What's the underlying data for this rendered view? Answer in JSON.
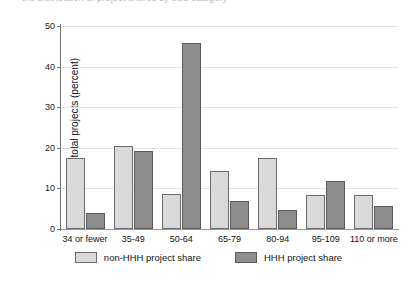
{
  "figure": {
    "top_caption_fragment": "the distribution of project shares by size category"
  },
  "chart_data": {
    "type": "bar",
    "title": "",
    "xlabel": "",
    "ylabel": "Share of total projects (percent)",
    "categories": [
      "34 or fewer",
      "35-49",
      "50-64",
      "65-79",
      "80-94",
      "95-109",
      "110 or more"
    ],
    "series": [
      {
        "name": "non-HHH project share",
        "color": "#d9d9d9",
        "values": [
          17.6,
          20.4,
          8.7,
          14.4,
          17.4,
          8.5,
          8.5
        ]
      },
      {
        "name": "HHH project share",
        "color": "#8e8e8e",
        "values": [
          4.0,
          19.3,
          45.9,
          6.9,
          4.8,
          11.9,
          5.7
        ]
      }
    ],
    "ylim": [
      0,
      50
    ],
    "yticks": [
      0,
      10,
      20,
      30,
      40,
      50
    ],
    "ytick_labels": [
      "0",
      "10",
      "20",
      "30",
      "40",
      "50"
    ],
    "grid": true,
    "legend_position": "bottom-center"
  }
}
